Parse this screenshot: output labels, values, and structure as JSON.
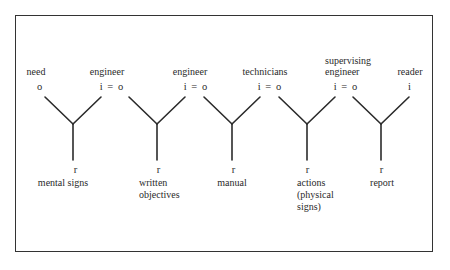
{
  "diagram": {
    "type": "semiotic-chain",
    "nodes": [
      {
        "top_label": "need",
        "top_symbol": "o",
        "bottom_symbol": "r",
        "bottom_label": "mental signs"
      },
      {
        "top_label": "engineer",
        "top_symbol": "i = o",
        "bottom_symbol": "r",
        "bottom_label": "written objectives"
      },
      {
        "top_label": "engineer",
        "top_symbol": "i = o",
        "bottom_symbol": "r",
        "bottom_label": "manual"
      },
      {
        "top_label": "technicians",
        "top_symbol": "i = o",
        "bottom_symbol": "r",
        "bottom_label": "actions (physical signs)"
      },
      {
        "top_label": "supervising engineer",
        "top_symbol": "i = o",
        "bottom_symbol": "r",
        "bottom_label": "report"
      },
      {
        "top_label": "reader",
        "top_symbol": "i"
      }
    ],
    "labels": {
      "need": "need",
      "engineer1": "engineer",
      "engineer2": "engineer",
      "technicians": "technicians",
      "supervising_line1": "supervising",
      "supervising_line2": "engineer",
      "reader": "reader",
      "sym_o": "o",
      "sym_io": "i = o",
      "sym_i": "i",
      "sym_r": "r",
      "mental_signs": "mental signs",
      "written_line1": "written",
      "written_line2": "objectives",
      "manual": "manual",
      "actions_line1": "actions",
      "actions_line2": "(physical",
      "actions_line3": "signs)",
      "report": "report"
    }
  }
}
